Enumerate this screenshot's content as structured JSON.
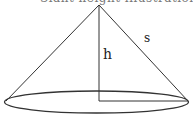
{
  "diagram": {
    "type": "cone",
    "caption_clipped": "Slant height illustration",
    "labels": {
      "height": "h",
      "slant": "s"
    },
    "colors": {
      "stroke": "#333333",
      "background": "#ffffff"
    }
  }
}
